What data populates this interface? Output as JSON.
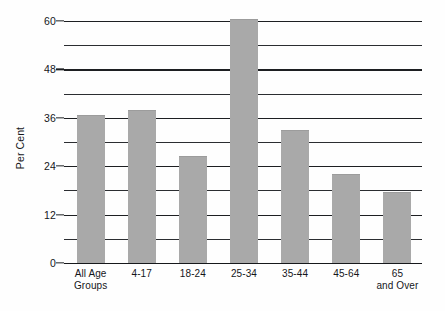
{
  "chart_data": {
    "type": "bar",
    "title": "",
    "subtitle": "",
    "xlabel": "",
    "ylabel": "Per Cent",
    "categories": [
      "All Age Groups",
      "4-17",
      "18-24",
      "25-34",
      "35-44",
      "45-64",
      "65 and Over"
    ],
    "category_lines": [
      [
        "All Age",
        "Groups"
      ],
      [
        "4-17",
        ""
      ],
      [
        "18-24",
        ""
      ],
      [
        "25-34",
        ""
      ],
      [
        "35-44",
        ""
      ],
      [
        "45-64",
        ""
      ],
      [
        "65",
        "and Over"
      ]
    ],
    "values": [
      36.7,
      38.0,
      26.5,
      60.5,
      33.0,
      22.0,
      17.5
    ],
    "ylim": [
      0,
      60
    ],
    "yticks": [
      0,
      12,
      24,
      36,
      48,
      60
    ],
    "ytick_labels": [
      "0",
      "12",
      "24",
      "36",
      "48",
      "60"
    ],
    "gridline_values": [
      0,
      6,
      12,
      18,
      24,
      30,
      36,
      42,
      48,
      54,
      60
    ],
    "grid": true,
    "legend": "none",
    "bar_color": "#a9a9a9",
    "grid_color": "#2b2d31",
    "text_color": "#15161a",
    "background": "#ffffff"
  }
}
